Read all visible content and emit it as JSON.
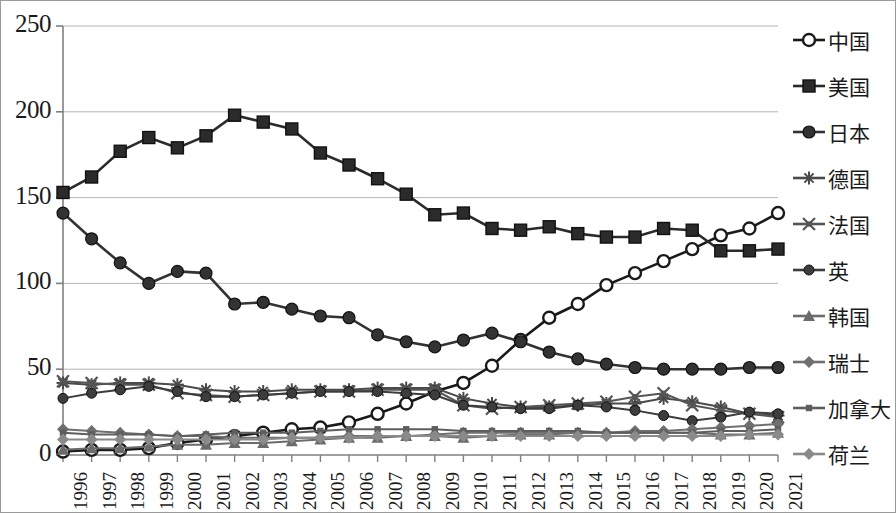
{
  "chart_data": {
    "type": "line",
    "title": "",
    "xlabel": "",
    "ylabel": "",
    "ylim": [
      0,
      250
    ],
    "yticks": [
      0,
      50,
      100,
      150,
      200,
      250
    ],
    "grid": true,
    "legend_position": "right",
    "categories": [
      "1996",
      "1997",
      "1998",
      "1999",
      "2000",
      "2001",
      "2002",
      "2003",
      "2004",
      "2005",
      "2006",
      "2007",
      "2008",
      "2009",
      "2010",
      "2011",
      "2012",
      "2013",
      "2014",
      "2015",
      "2016",
      "2017",
      "2018",
      "2019",
      "2020",
      "2021"
    ],
    "series": [
      {
        "name": "中国",
        "marker": "open-circle",
        "color": "#1a1a1a",
        "values": [
          2,
          3,
          3,
          4,
          7,
          9,
          11,
          13,
          15,
          16,
          19,
          24,
          30,
          37,
          42,
          52,
          67,
          80,
          88,
          99,
          106,
          113,
          120,
          128,
          132,
          141
        ]
      },
      {
        "name": "美国",
        "marker": "filled-square",
        "color": "#2b2b2b",
        "values": [
          153,
          162,
          177,
          185,
          179,
          186,
          198,
          194,
          190,
          176,
          169,
          161,
          152,
          140,
          141,
          132,
          131,
          133,
          129,
          127,
          127,
          132,
          131,
          119,
          119,
          120
        ]
      },
      {
        "name": "日本",
        "marker": "filled-circle",
        "color": "#333333",
        "values": [
          141,
          126,
          112,
          100,
          107,
          106,
          88,
          89,
          85,
          81,
          80,
          70,
          66,
          63,
          67,
          71,
          66,
          60,
          56,
          53,
          51,
          50,
          50,
          50,
          51,
          51
        ]
      },
      {
        "name": "德国",
        "marker": "asterisk",
        "color": "#4a4a4a",
        "values": [
          42,
          41,
          42,
          42,
          41,
          38,
          37,
          37,
          38,
          38,
          38,
          39,
          39,
          39,
          33,
          30,
          28,
          28,
          29,
          30,
          30,
          33,
          31,
          28,
          24,
          23
        ]
      },
      {
        "name": "法国",
        "marker": "x-mark",
        "color": "#555555",
        "values": [
          43,
          42,
          41,
          41,
          36,
          35,
          34,
          35,
          36,
          37,
          37,
          38,
          38,
          38,
          29,
          27,
          28,
          29,
          30,
          31,
          34,
          36,
          29,
          26,
          24,
          22
        ]
      },
      {
        "name": "英",
        "marker": "filled-circle-small",
        "color": "#3d3d3d",
        "values": [
          33,
          36,
          38,
          40,
          37,
          34,
          34,
          35,
          36,
          37,
          37,
          37,
          36,
          35,
          29,
          28,
          27,
          27,
          29,
          28,
          26,
          23,
          20,
          22,
          25,
          24
        ]
      },
      {
        "name": "韩国",
        "marker": "triangle",
        "color": "#6b6b6b",
        "values": [
          3,
          4,
          4,
          5,
          6,
          6,
          7,
          7,
          8,
          9,
          10,
          10,
          11,
          11,
          10,
          11,
          12,
          12,
          13,
          13,
          13,
          13,
          13,
          12,
          12,
          13
        ]
      },
      {
        "name": "瑞士",
        "marker": "diamond",
        "color": "#6f6f6f",
        "values": [
          15,
          14,
          13,
          12,
          11,
          11,
          10,
          10,
          10,
          10,
          11,
          11,
          11,
          12,
          13,
          13,
          13,
          13,
          13,
          13,
          14,
          14,
          15,
          16,
          17,
          18
        ]
      },
      {
        "name": "加拿大",
        "marker": "small-square",
        "color": "#5e5e5e",
        "values": [
          13,
          12,
          12,
          12,
          11,
          12,
          13,
          13,
          13,
          14,
          15,
          15,
          15,
          15,
          14,
          14,
          14,
          14,
          14,
          13,
          13,
          13,
          13,
          14,
          14,
          15
        ]
      },
      {
        "name": "荷兰",
        "marker": "diamond-light",
        "color": "#8a8a8a",
        "values": [
          9,
          9,
          9,
          9,
          9,
          9,
          9,
          9,
          10,
          10,
          10,
          11,
          11,
          11,
          11,
          11,
          11,
          11,
          11,
          11,
          11,
          11,
          11,
          11,
          12,
          12
        ]
      }
    ]
  }
}
